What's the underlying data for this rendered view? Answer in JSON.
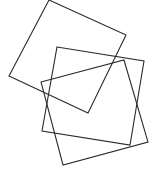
{
  "canvas": {
    "width": 152,
    "height": 170,
    "background": "#ffffff",
    "stroke_color": "#2b2b2b"
  },
  "shapes": [
    {
      "name": "square-top",
      "type": "polygon",
      "points": [
        [
          49,
          0
        ],
        [
          126,
          35
        ],
        [
          88,
          113
        ],
        [
          9,
          76
        ]
      ]
    },
    {
      "name": "square-middle",
      "type": "polygon",
      "points": [
        [
          57,
          47
        ],
        [
          144,
          61
        ],
        [
          130,
          145
        ],
        [
          42,
          131
        ]
      ]
    },
    {
      "name": "square-bottom",
      "type": "polygon",
      "points": [
        [
          41,
          82
        ],
        [
          124,
          60
        ],
        [
          148,
          142
        ],
        [
          63,
          165
        ]
      ]
    }
  ]
}
